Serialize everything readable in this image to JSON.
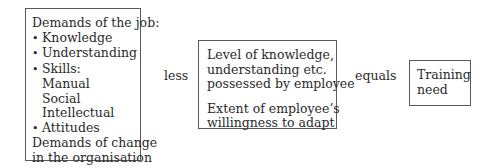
{
  "diagram": {
    "type": "equation-flow",
    "box1": {
      "title": "Demands of the job:",
      "items": [
        {
          "text": "Knowledge",
          "bullet": true
        },
        {
          "text": "Understanding",
          "bullet": true
        },
        {
          "text": "Skills:",
          "bullet": true
        },
        {
          "text": "Manual",
          "bullet": false,
          "indent": true
        },
        {
          "text": "Social",
          "bullet": false,
          "indent": true
        },
        {
          "text": "Intellectual",
          "bullet": false,
          "indent": true
        },
        {
          "text": "Attitudes",
          "bullet": true
        }
      ],
      "footer_line1": "Demands of change",
      "footer_line2": "in the organisation"
    },
    "operator1": "less",
    "box2": {
      "para1": [
        "Level of knowledge,",
        "understanding etc.",
        "possessed by employee"
      ],
      "para2": [
        "Extent of employee’s",
        "willingness to adapt"
      ]
    },
    "operator2": "equals",
    "box3": {
      "lines": [
        "Training",
        "need"
      ]
    }
  }
}
